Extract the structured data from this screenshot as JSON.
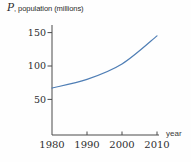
{
  "figure": {
    "title_variable": "P",
    "title_rest": ", population (millions)",
    "x_axis_label": "year"
  },
  "chart_data": {
    "type": "line",
    "title": "P, population (millions)",
    "xlabel": "year",
    "ylabel": "P, population (millions)",
    "x": [
      1980,
      1990,
      2000,
      2010
    ],
    "series": [
      {
        "name": "population",
        "values": [
          67,
          80,
          103,
          145
        ]
      }
    ],
    "x_ticks": [
      1980,
      1990,
      2000,
      2010
    ],
    "y_ticks": [
      50,
      100,
      150
    ],
    "xlim": [
      1980,
      2010
    ],
    "ylim": [
      0,
      160
    ],
    "grid": false,
    "legend": null,
    "colors": {
      "line": "#4f7eb5",
      "axis": "#4a4a4a",
      "text": "#2e2e2e"
    }
  }
}
